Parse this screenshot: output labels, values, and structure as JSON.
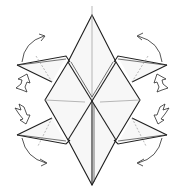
{
  "diagram": {
    "title": "",
    "colors": {
      "background": "#ffffff",
      "paper": "#f7f7f7",
      "edge": "#1f1f1f",
      "crease": "#9a9a9a"
    },
    "symbols": [
      {
        "name": "swing-arrow-top-left",
        "meaning": "fold flap up"
      },
      {
        "name": "swing-arrow-bottom-left",
        "meaning": "fold flap down"
      },
      {
        "name": "swing-arrow-top-right",
        "meaning": "fold flap up"
      },
      {
        "name": "swing-arrow-bottom-right",
        "meaning": "fold flap down"
      },
      {
        "name": "push-arrow-left-upper",
        "meaning": "squash/sink"
      },
      {
        "name": "push-arrow-left-lower",
        "meaning": "squash/sink"
      },
      {
        "name": "push-arrow-right-upper",
        "meaning": "squash/sink"
      },
      {
        "name": "push-arrow-right-lower",
        "meaning": "squash/sink"
      }
    ]
  }
}
